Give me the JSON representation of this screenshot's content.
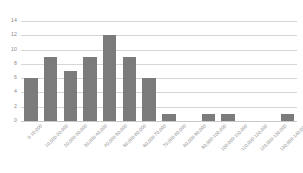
{
  "chart_data": {
    "type": "bar",
    "title": "",
    "subtitle": "",
    "xlabel": "",
    "ylabel": "",
    "ylim": [
      0,
      14
    ],
    "yticks": [
      0,
      2,
      4,
      6,
      8,
      10,
      12,
      14
    ],
    "ytick_labels": [
      "0",
      "2",
      "4",
      "6",
      "8",
      "10",
      "12",
      "14"
    ],
    "grid": true,
    "legend": "none",
    "bar_color": "#7b7b7b",
    "gridline_color": "#d6d6d6",
    "tick_label_color": "#8a8a8a",
    "categories": [
      "0-10,000",
      "10,000-20,000",
      "20,000-30,000",
      "30,000-40,000",
      "40,000-50,000",
      "50,000-60,000",
      "60,000-70,000",
      "70,000-80,000",
      "80,000-90,000",
      "90,000-100,000",
      "100,000-110,000",
      "110,000-120,000",
      "120,000-130,000",
      "130,000-140,000"
    ],
    "values": [
      6,
      9,
      7,
      9,
      12,
      9,
      6,
      1,
      0,
      1,
      1,
      0,
      0,
      1
    ]
  }
}
